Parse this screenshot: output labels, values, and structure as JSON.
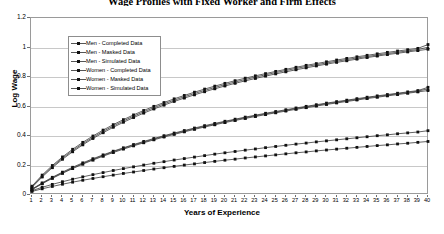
{
  "chart_data": {
    "type": "line",
    "title": "Wage Profiles with Fixed Worker and Firm Effects",
    "xlabel": "Years of Experience",
    "ylabel": "Log Wage",
    "xlim": [
      1,
      40
    ],
    "ylim": [
      0,
      1.2
    ],
    "yticks": [
      0,
      0.2,
      0.4,
      0.6,
      0.8,
      1,
      1.2
    ],
    "ytick_labels": [
      "0",
      "0.2",
      "0.4",
      "0.6",
      "0.8",
      "1",
      "1.2"
    ],
    "x": [
      1,
      2,
      3,
      4,
      5,
      6,
      7,
      8,
      9,
      10,
      11,
      12,
      13,
      14,
      15,
      16,
      17,
      18,
      19,
      20,
      21,
      22,
      23,
      24,
      25,
      26,
      27,
      28,
      29,
      30,
      31,
      32,
      33,
      34,
      35,
      36,
      37,
      38,
      39,
      40
    ],
    "xtick_labels": [
      "1",
      "2",
      "3",
      "4",
      "5",
      "6",
      "7",
      "8",
      "9",
      "10",
      "11",
      "12",
      "13",
      "14",
      "15",
      "16",
      "17",
      "18",
      "19",
      "20",
      "21",
      "22",
      "23",
      "24",
      "25",
      "26",
      "27",
      "28",
      "29",
      "30",
      "31",
      "32",
      "33",
      "34",
      "35",
      "36",
      "37",
      "38",
      "39",
      "40"
    ],
    "grid": true,
    "legend_position": "top-left",
    "series": [
      {
        "name": "Men - Completed Data",
        "marker": "square",
        "values": [
          0.06,
          0.135,
          0.2,
          0.258,
          0.31,
          0.357,
          0.4,
          0.44,
          0.477,
          0.511,
          0.543,
          0.573,
          0.601,
          0.627,
          0.652,
          0.675,
          0.697,
          0.718,
          0.738,
          0.757,
          0.775,
          0.792,
          0.808,
          0.823,
          0.838,
          0.852,
          0.866,
          0.879,
          0.891,
          0.903,
          0.915,
          0.926,
          0.937,
          0.947,
          0.957,
          0.967,
          0.976,
          0.985,
          0.994,
          1.02
        ]
      },
      {
        "name": "Men - Masked Data",
        "marker": "square",
        "values": [
          0.052,
          0.122,
          0.185,
          0.242,
          0.293,
          0.34,
          0.383,
          0.422,
          0.459,
          0.493,
          0.525,
          0.555,
          0.583,
          0.609,
          0.634,
          0.657,
          0.679,
          0.7,
          0.72,
          0.739,
          0.757,
          0.774,
          0.79,
          0.806,
          0.821,
          0.835,
          0.849,
          0.862,
          0.875,
          0.887,
          0.899,
          0.91,
          0.921,
          0.932,
          0.942,
          0.952,
          0.961,
          0.97,
          0.979,
          0.988
        ]
      },
      {
        "name": "Men - Simulated Data",
        "marker": "triangle",
        "values": [
          0.056,
          0.128,
          0.192,
          0.25,
          0.301,
          0.348,
          0.391,
          0.431,
          0.468,
          0.502,
          0.534,
          0.564,
          0.592,
          0.618,
          0.643,
          0.666,
          0.688,
          0.709,
          0.729,
          0.748,
          0.766,
          0.783,
          0.799,
          0.815,
          0.83,
          0.844,
          0.858,
          0.871,
          0.883,
          0.895,
          0.907,
          0.918,
          0.929,
          0.939,
          0.949,
          0.959,
          0.968,
          0.977,
          0.986,
          1.002
        ]
      },
      {
        "name": "Women - Completed Data",
        "marker": "square",
        "values": [
          0.04,
          0.082,
          0.12,
          0.155,
          0.188,
          0.218,
          0.246,
          0.272,
          0.297,
          0.32,
          0.342,
          0.363,
          0.383,
          0.402,
          0.42,
          0.437,
          0.454,
          0.47,
          0.485,
          0.5,
          0.514,
          0.528,
          0.541,
          0.554,
          0.566,
          0.578,
          0.59,
          0.601,
          0.612,
          0.623,
          0.633,
          0.643,
          0.653,
          0.663,
          0.672,
          0.681,
          0.69,
          0.699,
          0.708,
          0.73
        ]
      },
      {
        "name": "Women - Masked Data",
        "marker": "square",
        "values": [
          0.036,
          0.076,
          0.113,
          0.147,
          0.179,
          0.209,
          0.237,
          0.263,
          0.288,
          0.311,
          0.333,
          0.354,
          0.374,
          0.393,
          0.411,
          0.428,
          0.445,
          0.461,
          0.476,
          0.491,
          0.505,
          0.519,
          0.532,
          0.545,
          0.557,
          0.569,
          0.581,
          0.592,
          0.603,
          0.614,
          0.624,
          0.634,
          0.644,
          0.654,
          0.663,
          0.672,
          0.681,
          0.69,
          0.699,
          0.708
        ]
      },
      {
        "name": "Women - Simulated Data",
        "marker": "triangle",
        "values": [
          0.038,
          0.079,
          0.116,
          0.151,
          0.183,
          0.213,
          0.241,
          0.268,
          0.293,
          0.316,
          0.338,
          0.359,
          0.379,
          0.398,
          0.416,
          0.433,
          0.45,
          0.466,
          0.481,
          0.496,
          0.51,
          0.524,
          0.537,
          0.55,
          0.562,
          0.574,
          0.586,
          0.597,
          0.608,
          0.619,
          0.629,
          0.639,
          0.649,
          0.659,
          0.668,
          0.677,
          0.686,
          0.695,
          0.704,
          0.72
        ]
      },
      {
        "name": "Low - Completed Data",
        "marker": "square",
        "values": [
          0.03,
          0.052,
          0.072,
          0.09,
          0.107,
          0.123,
          0.138,
          0.152,
          0.166,
          0.179,
          0.191,
          0.203,
          0.215,
          0.226,
          0.237,
          0.247,
          0.257,
          0.267,
          0.277,
          0.286,
          0.295,
          0.304,
          0.312,
          0.321,
          0.329,
          0.337,
          0.345,
          0.352,
          0.36,
          0.367,
          0.374,
          0.381,
          0.388,
          0.395,
          0.402,
          0.408,
          0.415,
          0.421,
          0.427,
          0.436
        ]
      },
      {
        "name": "Low - Masked Data",
        "marker": "square",
        "values": [
          0.024,
          0.042,
          0.058,
          0.073,
          0.087,
          0.1,
          0.112,
          0.124,
          0.135,
          0.146,
          0.156,
          0.166,
          0.176,
          0.185,
          0.194,
          0.203,
          0.211,
          0.22,
          0.228,
          0.236,
          0.243,
          0.251,
          0.258,
          0.265,
          0.272,
          0.279,
          0.286,
          0.292,
          0.299,
          0.305,
          0.311,
          0.317,
          0.323,
          0.329,
          0.335,
          0.34,
          0.346,
          0.351,
          0.357,
          0.363
        ]
      }
    ]
  },
  "legend": {
    "items": [
      {
        "label": "Men - Completed Data"
      },
      {
        "label": "Men - Masked Data"
      },
      {
        "label": "Men - Simulated Data"
      },
      {
        "label": "Women - Completed Data"
      },
      {
        "label": "Women - Masked Data"
      },
      {
        "label": "Women - Simulated Data"
      }
    ]
  },
  "colors": {
    "line": "#3a3a3a",
    "marker": "#111111",
    "grid": "#c8c8c8",
    "border": "#9a9a9a"
  }
}
